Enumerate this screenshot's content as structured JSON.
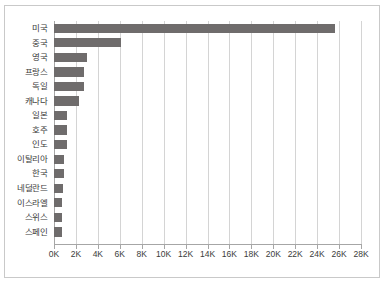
{
  "chart_data": {
    "type": "bar",
    "orientation": "horizontal",
    "title": "",
    "subtitle": "",
    "xlabel": "",
    "ylabel": "",
    "categories": [
      "미국",
      "중국",
      "영국",
      "프랑스",
      "독일",
      "캐나다",
      "일본",
      "호주",
      "인도",
      "이탈리아",
      "한국",
      "네덜란드",
      "이스라엘",
      "스위스",
      "스페인"
    ],
    "values": [
      25600,
      6100,
      3000,
      2750,
      2700,
      2300,
      1200,
      1150,
      1150,
      950,
      900,
      780,
      760,
      740,
      700
    ],
    "series": [
      {
        "name": "",
        "values": [
          25600,
          6100,
          3000,
          2750,
          2700,
          2300,
          1200,
          1150,
          1150,
          950,
          900,
          780,
          760,
          740,
          700
        ]
      }
    ],
    "tick_labels": [
      "0K",
      "2K",
      "4K",
      "6K",
      "8K",
      "10K",
      "12K",
      "14K",
      "16K",
      "18K",
      "20K",
      "22K",
      "24K",
      "26K",
      "28K"
    ],
    "tick_values": [
      0,
      2000,
      4000,
      6000,
      8000,
      10000,
      12000,
      14000,
      16000,
      18000,
      20000,
      22000,
      24000,
      26000,
      28000
    ],
    "xlim": [
      0,
      28000
    ],
    "grid": "vertical",
    "legend": "none",
    "colors": {
      "bar": "#6f6c6c",
      "gridline": "#d4d4d4",
      "axis": "#a6a6a6",
      "text": "#3b3b3b",
      "frame": "#c9c9c9",
      "background": "#ffffff"
    }
  }
}
